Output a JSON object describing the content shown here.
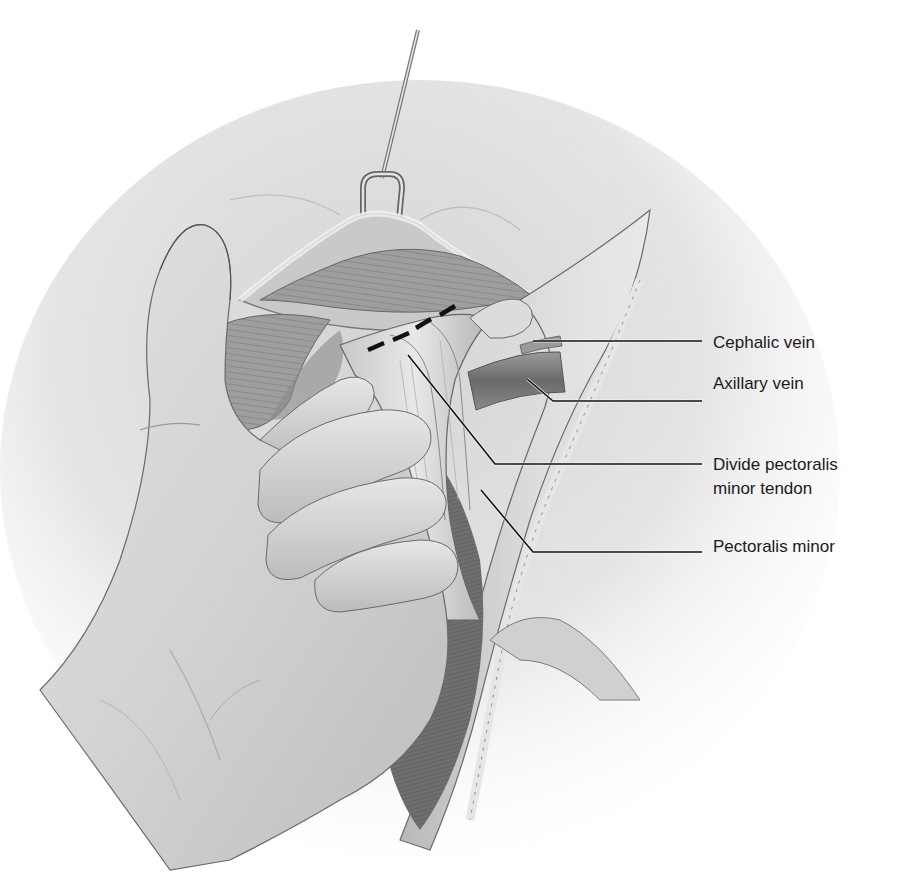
{
  "figure": {
    "palette": {
      "background": "#ffffff",
      "skin_light": "#e6e6e6",
      "skin_mid": "#cfcfcf",
      "skin_dark": "#9a9a9a",
      "glove_light": "#dcdcdc",
      "glove_shadow": "#a8a8a8",
      "muscle": "#9c9c9c",
      "muscle_dark": "#6e6e6e",
      "vein": "#7a7a7a",
      "outline": "#555555",
      "leader_line": "#111111",
      "cut_line": "#111111",
      "label_text": "#1a1a1a"
    }
  },
  "labels": [
    {
      "id": "cephalic-vein",
      "lines": [
        "Cephalic vein"
      ],
      "top": 331,
      "leader": "M533,341 L702,341"
    },
    {
      "id": "axillary-vein",
      "lines": [
        "Axillary vein"
      ],
      "top": 372,
      "leader": "M527,379 L553,401 L702,401"
    },
    {
      "id": "divide-pectoralis-minor-tendon",
      "lines": [
        "Divide pectoralis",
        "minor tendon"
      ],
      "top": 453,
      "leader": "M408,355 L495,464 L702,464"
    },
    {
      "id": "pectoralis-minor",
      "lines": [
        "Pectoralis minor"
      ],
      "top": 535,
      "leader": "M481,490 L533,552 L702,552"
    }
  ],
  "cut_line": {
    "description": "Dashed line across pectoralis minor tendon indicating division site",
    "dashes": [
      "M368,350 L384,343",
      "M393,340 L409,333",
      "M416,328 L431,319",
      "M440,315 L455,306"
    ]
  }
}
